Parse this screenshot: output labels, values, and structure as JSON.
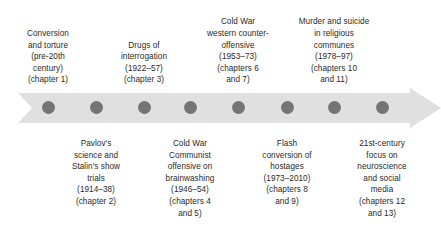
{
  "figure": {
    "type": "timeline",
    "orientation": "horizontal",
    "direction": "left-to-right",
    "milestone_count": 8,
    "colors": {
      "arrow_fill": "#e0e0e0",
      "dot_fill": "#757575",
      "text": "#2a2a2a",
      "background": "#ffffff"
    }
  },
  "milestones": [
    {
      "index": 1,
      "position": "above",
      "x": 48,
      "label": "Conversion\nand torture\n(pre-20th\ncentury)\n(chapter 1)",
      "topic": "Conversion and torture",
      "period": "pre-20th century",
      "chapters": "chapter 1"
    },
    {
      "index": 2,
      "position": "below",
      "x": 96,
      "label": "Pavlov's\nscience and\nStalin's show\ntrials\n(1914–38)\n(chapter 2)",
      "topic": "Pavlov's science and Stalin's show trials",
      "period": "1914–38",
      "chapters": "chapter 2"
    },
    {
      "index": 3,
      "position": "above",
      "x": 144,
      "label": "Drugs of\ninterrogation\n(1922–57)\n(chapter 3)",
      "topic": "Drugs of interrogation",
      "period": "1922–57",
      "chapters": "chapter 3"
    },
    {
      "index": 4,
      "position": "below",
      "x": 190,
      "label": "Cold War\nCommunist\noffensive on\nbrainwashing\n(1946–54)\n(chapters 4\nand 5)",
      "topic": "Cold War Communist offensive on brainwashing",
      "period": "1946–54",
      "chapters": "chapters 4 and 5"
    },
    {
      "index": 5,
      "position": "above",
      "x": 238,
      "label": "Cold War\nwestern counter-\noffensive\n(1953–73)\n(chapters 6\nand 7)",
      "topic": "Cold War western counter-offensive",
      "period": "1953–73",
      "chapters": "chapters 6 and 7"
    },
    {
      "index": 6,
      "position": "below",
      "x": 287,
      "label": "Flash\nconversion of\nhostages\n(1973–2010)\n(chapters 8\nand 9)",
      "topic": "Flash conversion of hostages",
      "period": "1973–2010",
      "chapters": "chapters 8 and 9"
    },
    {
      "index": 7,
      "position": "above",
      "x": 334,
      "label": "Murder and suicide\nin religious\ncommunes\n(1978–97)\n(chapters 10\nand 11)",
      "topic": "Murder and suicide in religious communes",
      "period": "1978–97",
      "chapters": "chapters 10 and 11"
    },
    {
      "index": 8,
      "position": "below",
      "x": 382,
      "label": "21st-century\nfocus on\nneuroscience\nand social\nmedia\n(chapters 12\nand 13)",
      "topic": "21st-century focus on neuroscience and social media",
      "period": "21st century",
      "chapters": "chapters 12 and 13"
    }
  ]
}
